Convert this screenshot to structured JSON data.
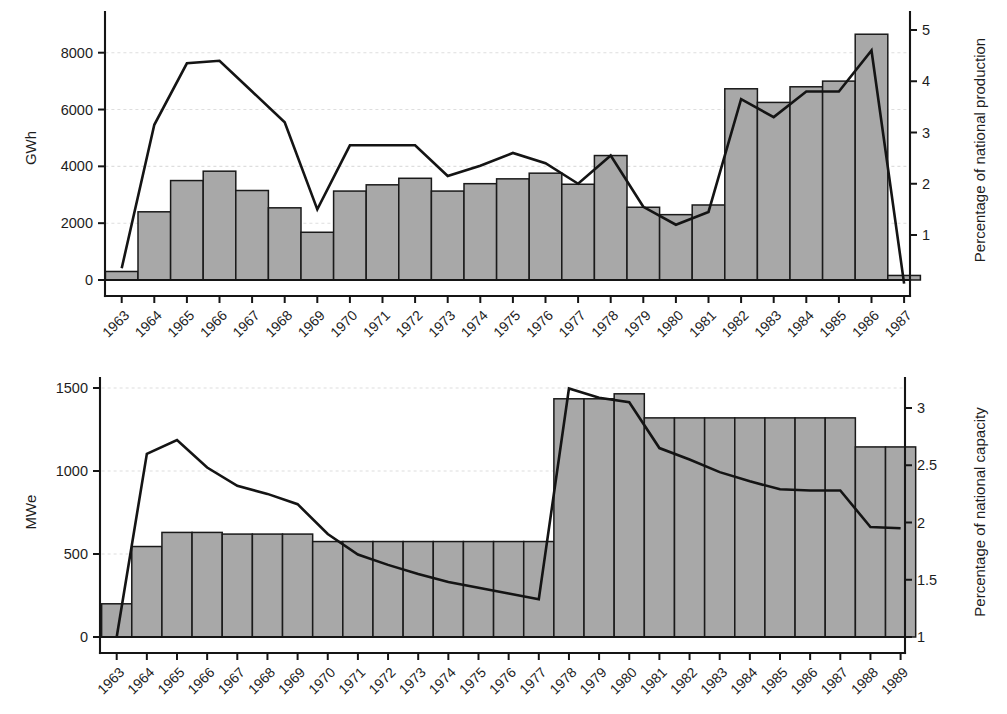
{
  "figure": {
    "background": "#ffffff",
    "bar_fill": "#a8a8a8",
    "bar_stroke": "#1a1a1a",
    "line_color": "#141414",
    "grid_color": "#dedede"
  },
  "chart_data": [
    {
      "id": "top",
      "type": "bar",
      "title": "",
      "xlabel": "",
      "ylabel": "GWh",
      "y2label": "Percentage of national production",
      "grid": true,
      "legend": "none",
      "ylim": [
        0,
        9000
      ],
      "yticks": [
        0,
        2000,
        4000,
        6000,
        8000
      ],
      "ytick_labels": [
        "0",
        "2000",
        "4000",
        "6000",
        "8000"
      ],
      "y2lim": [
        0,
        5.6
      ],
      "y2ticks": [
        1,
        2,
        3,
        4,
        5
      ],
      "y2tick_labels": [
        "1",
        "2",
        "3",
        "4",
        "5"
      ],
      "categories": [
        "1963",
        "1964",
        "1965",
        "1966",
        "1967",
        "1968",
        "1969",
        "1970",
        "1971",
        "1972",
        "1973",
        "1974",
        "1975",
        "1976",
        "1977",
        "1978",
        "1979",
        "1980",
        "1981",
        "1982",
        "1983",
        "1984",
        "1985",
        "1986",
        "1987"
      ],
      "values": [
        300,
        2400,
        3500,
        3830,
        3150,
        2540,
        1680,
        3130,
        3350,
        3580,
        3130,
        3390,
        3560,
        3760,
        3370,
        4380,
        2560,
        2300,
        2640,
        6730,
        6250,
        6800,
        7000,
        8650,
        160
      ],
      "series": [
        {
          "name": "Percentage of national production",
          "axis": "right",
          "type": "line",
          "values": [
            0.35,
            3.15,
            4.35,
            4.4,
            3.8,
            3.2,
            1.5,
            2.75,
            2.75,
            2.75,
            2.15,
            2.35,
            2.6,
            2.4,
            2.0,
            2.55,
            1.55,
            1.2,
            1.45,
            3.65,
            3.3,
            3.8,
            3.8,
            4.6,
            0.05
          ]
        }
      ]
    },
    {
      "id": "bottom",
      "type": "bar",
      "title": "",
      "xlabel": "",
      "ylabel": "MWe",
      "y2label": "Percentage of national capacity",
      "grid": true,
      "legend": "none",
      "ylim": [
        0,
        1600
      ],
      "yticks": [
        0,
        500,
        1000,
        1500
      ],
      "ytick_labels": [
        "0",
        "500",
        "1000",
        "1500"
      ],
      "y2lim": [
        1,
        3.32
      ],
      "y2ticks": [
        1,
        1.5,
        2,
        2.5,
        3
      ],
      "y2tick_labels": [
        "1",
        "1.5",
        "2",
        "2.5",
        "3"
      ],
      "categories": [
        "1963",
        "1964",
        "1965",
        "1966",
        "1967",
        "1968",
        "1969",
        "1970",
        "1971",
        "1972",
        "1973",
        "1974",
        "1975",
        "1976",
        "1977",
        "1978",
        "1979",
        "1980",
        "1981",
        "1982",
        "1983",
        "1984",
        "1985",
        "1986",
        "1987",
        "1988",
        "1989"
      ],
      "values": [
        200,
        545,
        630,
        630,
        620,
        620,
        620,
        575,
        575,
        575,
        575,
        575,
        575,
        575,
        575,
        1435,
        1435,
        1465,
        1320,
        1320,
        1320,
        1320,
        1320,
        1320,
        1320,
        1145,
        1145
      ],
      "series": [
        {
          "name": "Percentage of national capacity",
          "axis": "right",
          "type": "line",
          "values": [
            1.0,
            2.6,
            2.72,
            2.48,
            2.32,
            2.25,
            2.16,
            1.9,
            1.72,
            1.63,
            1.55,
            1.48,
            1.43,
            1.38,
            1.33,
            3.17,
            3.09,
            3.05,
            2.65,
            2.55,
            2.44,
            2.36,
            2.29,
            2.28,
            2.28,
            1.96,
            1.95
          ]
        }
      ]
    }
  ]
}
